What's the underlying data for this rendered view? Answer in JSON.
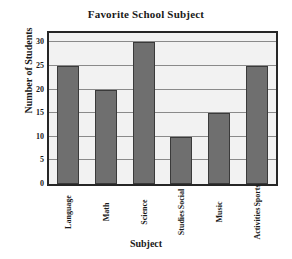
{
  "chart_data": {
    "type": "bar",
    "title": "Favorite School Subject",
    "xlabel": "Subject",
    "ylabel": "Number of Students",
    "categories": [
      "Language",
      "Math",
      "Science",
      "Social Studies",
      "Music",
      "Sports Activities"
    ],
    "category_lines": [
      [
        "Language"
      ],
      [
        "Math"
      ],
      [
        "Science"
      ],
      [
        "Social",
        "Studies"
      ],
      [
        "Music"
      ],
      [
        "Sports",
        "Activities"
      ]
    ],
    "values": [
      25,
      20,
      30,
      10,
      15,
      25
    ],
    "yticks": [
      0,
      5,
      10,
      15,
      20,
      25,
      30
    ],
    "ylim": [
      0,
      32
    ],
    "grid": true,
    "legend": false,
    "colors": {
      "bar_fill": "#6f6f6f",
      "bar_border": "#3a3a3a",
      "plot_background": "#f2f2f2",
      "gridline": "#8a8a8a",
      "axis_border": "#262626",
      "text": "#1a1a1a"
    }
  }
}
